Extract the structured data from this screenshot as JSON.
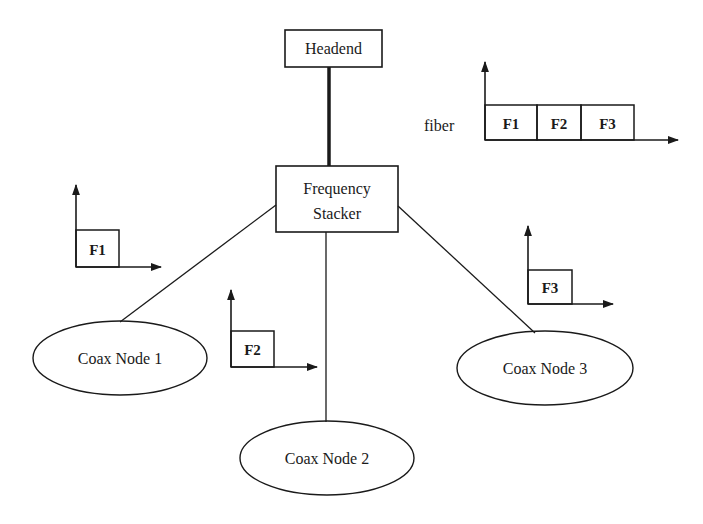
{
  "diagram": {
    "headend": {
      "label": "Headend"
    },
    "stacker": {
      "line1": "Frequency",
      "line2": "Stacker"
    },
    "nodes": [
      {
        "label": "Coax Node 1"
      },
      {
        "label": "Coax Node 2"
      },
      {
        "label": "Coax Node 3"
      }
    ],
    "fiber_spectrum": {
      "axis_label": "fiber",
      "bands": [
        "F1",
        "F2",
        "F3"
      ]
    },
    "node_spectra": [
      {
        "band": "F1"
      },
      {
        "band": "F2"
      },
      {
        "band": "F3"
      }
    ]
  }
}
